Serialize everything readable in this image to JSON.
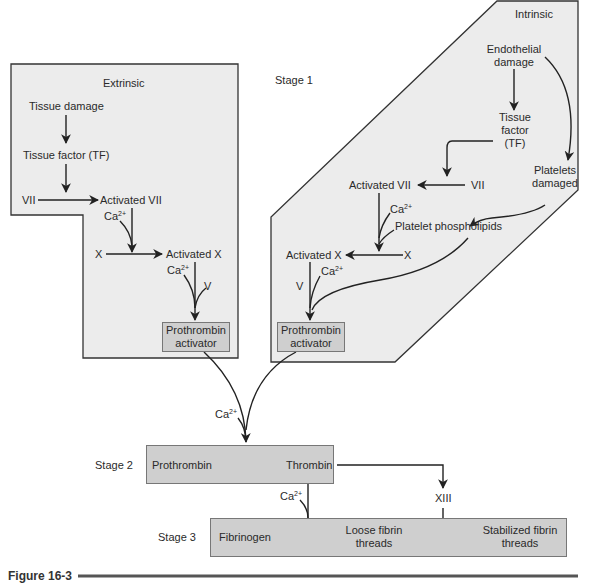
{
  "figure": {
    "caption": "Figure 16-3"
  },
  "stages": {
    "stage1": "Stage 1",
    "stage2": "Stage 2",
    "stage3": "Stage 3"
  },
  "extrinsic": {
    "title": "Extrinsic",
    "tissue_damage": "Tissue damage",
    "tissue_factor": "Tissue factor (TF)",
    "vii": "VII",
    "activated_vii": "Activated VII",
    "ca1_base": "Ca",
    "ca1_sup": "2+",
    "x": "X",
    "activated_x": "Activated X",
    "ca2_base": "Ca",
    "ca2_sup": "2+",
    "v": "V",
    "activator_line1": "Prothrombin",
    "activator_line2": "activator"
  },
  "intrinsic": {
    "title": "Intrinsic",
    "endothelial_line1": "Endothelial",
    "endothelial_line2": "damage",
    "tf_line1": "Tissue",
    "tf_line2": "factor",
    "tf_line3": "(TF)",
    "platelets_line1": "Platelets",
    "platelets_line2": "damaged",
    "activated_vii": "Activated VII",
    "vii": "VII",
    "ca1_base": "Ca",
    "ca1_sup": "2+",
    "phospholipids": "Platelet phospholipids",
    "activated_x": "Activated X",
    "x": "X",
    "v": "V",
    "ca2_base": "Ca",
    "ca2_sup": "2+",
    "activator_line1": "Prothrombin",
    "activator_line2": "activator"
  },
  "common": {
    "ca_base": "Ca",
    "ca_sup": "2+",
    "prothrombin": "Prothrombin",
    "thrombin": "Thrombin",
    "ca3_base": "Ca",
    "ca3_sup": "2+",
    "xiii": "XIII",
    "fibrinogen": "Fibrinogen",
    "loose_line1": "Loose fibrin",
    "loose_line2": "threads",
    "stabilized_line1": "Stabilized fibrin",
    "stabilized_line2": "threads"
  },
  "colors": {
    "panel_fill": "#ececec",
    "box_fill": "#cfcfcf",
    "stroke": "#2a2a2a"
  }
}
